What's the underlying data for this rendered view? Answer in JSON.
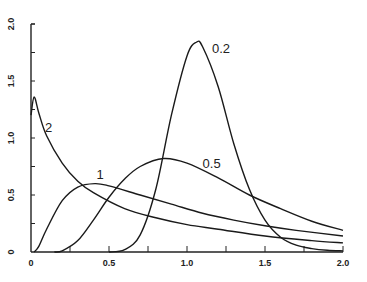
{
  "chart_data": {
    "type": "line",
    "title": "",
    "xlabel": "",
    "ylabel": "",
    "xlim": [
      0,
      2.0
    ],
    "ylim": [
      0,
      2.0
    ],
    "x_ticks": [
      "0",
      "0.5",
      "1.0",
      "1.5",
      "2.0"
    ],
    "y_ticks": [
      "0",
      "0.5",
      "1.0",
      "1.5",
      "2.0"
    ],
    "grid": false,
    "legend": "inline curve labels",
    "series": [
      {
        "name": "0.2",
        "label_pos": [
          1.16,
          1.75
        ],
        "x": [
          0.5,
          0.6,
          0.7,
          0.8,
          0.9,
          1.0,
          1.06,
          1.1,
          1.2,
          1.3,
          1.4,
          1.5,
          1.6,
          1.7,
          1.8,
          1.9,
          2.0
        ],
        "y": [
          0.0,
          0.02,
          0.15,
          0.55,
          1.2,
          1.72,
          1.84,
          1.8,
          1.45,
          0.95,
          0.55,
          0.28,
          0.13,
          0.06,
          0.03,
          0.015,
          0.01
        ]
      },
      {
        "name": "0.5",
        "label_pos": [
          1.1,
          0.74
        ],
        "x": [
          0.15,
          0.2,
          0.3,
          0.4,
          0.5,
          0.6,
          0.7,
          0.85,
          1.0,
          1.2,
          1.4,
          1.6,
          1.8,
          2.0
        ],
        "y": [
          0.0,
          0.01,
          0.1,
          0.28,
          0.48,
          0.64,
          0.75,
          0.82,
          0.78,
          0.65,
          0.5,
          0.38,
          0.27,
          0.19
        ]
      },
      {
        "name": "1",
        "label_pos": [
          0.42,
          0.64
        ],
        "x": [
          0.02,
          0.05,
          0.1,
          0.2,
          0.3,
          0.41,
          0.5,
          0.7,
          0.9,
          1.1,
          1.3,
          1.5,
          1.7,
          2.0
        ],
        "y": [
          0.0,
          0.05,
          0.2,
          0.45,
          0.57,
          0.6,
          0.58,
          0.5,
          0.42,
          0.34,
          0.28,
          0.23,
          0.19,
          0.14
        ]
      },
      {
        "name": "2",
        "label_pos": [
          0.09,
          1.05
        ],
        "x": [
          0.0,
          0.02,
          0.05,
          0.1,
          0.2,
          0.3,
          0.4,
          0.6,
          0.8,
          1.0,
          1.2,
          1.5,
          1.8,
          2.0
        ],
        "y": [
          1.2,
          1.36,
          1.22,
          1.02,
          0.78,
          0.62,
          0.52,
          0.38,
          0.3,
          0.24,
          0.2,
          0.14,
          0.1,
          0.08
        ]
      }
    ]
  }
}
